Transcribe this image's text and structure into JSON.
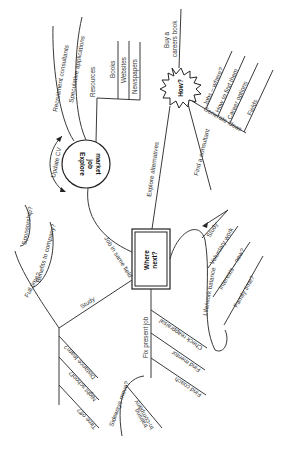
{
  "diagram": {
    "type": "mind-map",
    "orientation": "rotated-90",
    "central_node": {
      "label": "Where\nnext?",
      "line1": "Where",
      "line2": "next?",
      "shape": "double-border-rectangle"
    },
    "nodes": {
      "explore_job_market": {
        "line1": "Explore",
        "line2": "job",
        "line3": "market",
        "shape": "circle"
      },
      "how": {
        "label": "How?",
        "shape": "starburst"
      }
    },
    "branches": {
      "job_same_field": "Job in same field",
      "explore_alternatives": "Explore alternatives",
      "study": "Study",
      "fix_present_job": "Fix present job",
      "life_work_balance": "Life/work balance",
      "update_cv": "Update CV",
      "resources": "Resources",
      "books": "Books",
      "websites": "Websites",
      "newspapers": "Newspapers",
      "recruitment_consultants": "Recruitment consultants",
      "speculative_applications": "Speculative applications",
      "buy_careers_book_1": "Buy a",
      "buy_careers_book_2": "careers book",
      "generate_ideas": "Generate ideas",
      "jobs_where": "Jobs – where?",
      "how_to_find_them": "How to find them",
      "career_options": "Career options",
      "fields": "Fields",
      "find_consultant": "Find a consultant",
      "lwb_study": "Study",
      "voluntary_work": "Voluntary work",
      "interests_new": "Interests – new?",
      "family_time": "Family time?",
      "full_time": "Full time?",
      "sponsorship": "Sponsorship?",
      "benefits_to_company": "Benefits to company?",
      "distance_learn": "Distance learn?",
      "night_school": "Night school?",
      "time_off": "Time off?",
      "check_reappraisal": "Check reappraisal",
      "find_mentor": "Find mentor",
      "find_coach": "Find coach",
      "sideways_move": "Sideways move?",
      "incompany_training_1": "In-company",
      "incompany_training_2": "training"
    }
  }
}
